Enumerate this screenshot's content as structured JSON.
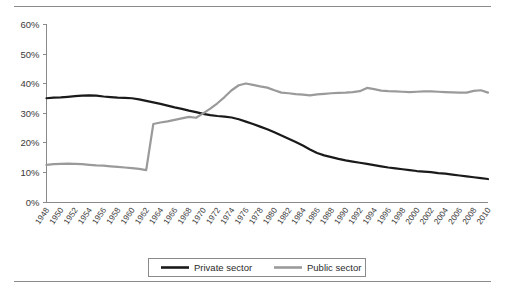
{
  "chart_data": {
    "type": "line",
    "title": "",
    "subtitle": "",
    "xlabel": "",
    "ylabel": "",
    "ylim": [
      0,
      60
    ],
    "yticks": [
      0,
      10,
      20,
      30,
      40,
      50,
      60
    ],
    "ytick_labels": [
      "0%",
      "10%",
      "20%",
      "30%",
      "40%",
      "50%",
      "60%"
    ],
    "grid": false,
    "legend_position": "bottom",
    "x": [
      1948,
      1949,
      1950,
      1951,
      1952,
      1953,
      1954,
      1955,
      1956,
      1957,
      1958,
      1959,
      1960,
      1961,
      1962,
      1963,
      1964,
      1965,
      1966,
      1967,
      1968,
      1969,
      1970,
      1971,
      1972,
      1973,
      1974,
      1975,
      1976,
      1977,
      1978,
      1979,
      1980,
      1981,
      1982,
      1983,
      1984,
      1985,
      1986,
      1987,
      1988,
      1989,
      1990,
      1991,
      1992,
      1993,
      1994,
      1995,
      1996,
      1997,
      1998,
      1999,
      2000,
      2001,
      2002,
      2003,
      2004,
      2005,
      2006,
      2007,
      2008,
      2009,
      2010
    ],
    "xtick_labels": [
      "1948",
      "1950",
      "1952",
      "1954",
      "1956",
      "1958",
      "1960",
      "1962",
      "1964",
      "1966",
      "1968",
      "1970",
      "1972",
      "1974",
      "1976",
      "1978",
      "1980",
      "1982",
      "1984",
      "1986",
      "1988",
      "1990",
      "1992",
      "1994",
      "1996",
      "1998",
      "2000",
      "2002",
      "2004",
      "2006",
      "2008",
      "2010"
    ],
    "series": [
      {
        "name": "Private sector",
        "color": "#1a1a1a",
        "width": 2.2,
        "values": [
          34.9,
          35.1,
          35.2,
          35.4,
          35.6,
          35.8,
          35.9,
          35.8,
          35.5,
          35.3,
          35.1,
          35.0,
          34.9,
          34.5,
          34.0,
          33.5,
          33.0,
          32.4,
          31.8,
          31.3,
          30.7,
          30.2,
          29.6,
          29.2,
          28.9,
          28.7,
          28.4,
          27.8,
          27.0,
          26.2,
          25.3,
          24.4,
          23.4,
          22.3,
          21.2,
          20.1,
          18.9,
          17.6,
          16.4,
          15.6,
          15.0,
          14.4,
          13.9,
          13.5,
          13.1,
          12.7,
          12.3,
          11.9,
          11.5,
          11.2,
          10.9,
          10.6,
          10.3,
          10.1,
          9.9,
          9.6,
          9.4,
          9.1,
          8.8,
          8.5,
          8.2,
          7.9,
          7.6
        ]
      },
      {
        "name": "Public sector",
        "color": "#9a9a9a",
        "width": 2.2,
        "values": [
          12.4,
          12.6,
          12.7,
          12.8,
          12.7,
          12.6,
          12.4,
          12.2,
          12.1,
          11.9,
          11.7,
          11.5,
          11.3,
          11.0,
          10.6,
          26.2,
          26.7,
          27.1,
          27.6,
          28.1,
          28.6,
          28.3,
          29.8,
          31.4,
          33.2,
          35.3,
          37.6,
          39.3,
          39.9,
          39.4,
          38.9,
          38.5,
          37.6,
          36.8,
          36.6,
          36.3,
          36.1,
          35.9,
          36.2,
          36.4,
          36.6,
          36.7,
          36.8,
          37.0,
          37.3,
          38.4,
          38.0,
          37.5,
          37.3,
          37.2,
          37.1,
          37.0,
          37.1,
          37.2,
          37.2,
          37.1,
          37.0,
          36.9,
          36.8,
          36.8,
          37.4,
          37.6,
          36.8
        ]
      }
    ]
  },
  "legend": {
    "items": [
      {
        "label": "Private sector"
      },
      {
        "label": "Public sector"
      }
    ]
  }
}
